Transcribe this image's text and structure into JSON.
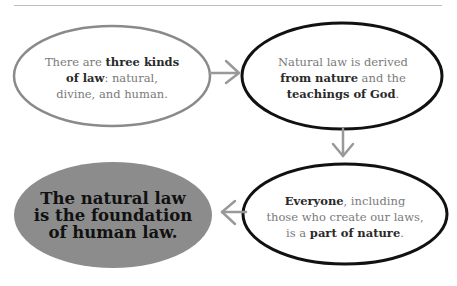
{
  "colors": {
    "outline_gray": "#8a8a8a",
    "outline_black": "#111111",
    "arrow_gray": "#999999",
    "fill_gray": "#8c8c8c",
    "text_gray": "#7a7a7a",
    "text_dark": "#2a2a2a"
  },
  "nodes": [
    {
      "id": "three-kinds",
      "parts": [
        {
          "text": "There are ",
          "bold": false
        },
        {
          "text": "three kinds of law",
          "bold": true
        },
        {
          "text": ": natural, divine, and human.",
          "bold": false
        }
      ]
    },
    {
      "id": "derived-from-nature",
      "parts": [
        {
          "text": "Natural law is derived ",
          "bold": false
        },
        {
          "text": "from nature",
          "bold": true
        },
        {
          "text": " and the ",
          "bold": false
        },
        {
          "text": "teachings of God",
          "bold": true
        },
        {
          "text": ".",
          "bold": false
        }
      ]
    },
    {
      "id": "everyone-part-of-nature",
      "parts": [
        {
          "text": "Everyone",
          "bold": true
        },
        {
          "text": ", including those who create our laws, is a ",
          "bold": false
        },
        {
          "text": "part of nature",
          "bold": true
        },
        {
          "text": ".",
          "bold": false
        }
      ]
    },
    {
      "id": "conclusion",
      "text": "The natural law is the foundation of human law."
    }
  ],
  "arrows": [
    {
      "from": "three-kinds",
      "to": "derived-from-nature",
      "direction": "right"
    },
    {
      "from": "derived-from-nature",
      "to": "everyone-part-of-nature",
      "direction": "down"
    },
    {
      "from": "everyone-part-of-nature",
      "to": "conclusion",
      "direction": "left"
    }
  ],
  "text": {
    "n1_a": "There are ",
    "n1_b": "three kinds",
    "n1_c": "of law",
    "n1_d": ": natural,",
    "n1_e": "divine, and human.",
    "n2_a": "Natural law is derived",
    "n2_b": "from nature",
    "n2_c": " and the",
    "n2_d": "teachings of God",
    "n2_e": ".",
    "n3_a": "Everyone",
    "n3_b": ", including",
    "n3_c": "those who create our laws,",
    "n3_d": "is a ",
    "n3_e": "part of nature",
    "n3_f": ".",
    "n4_a": "The natural law",
    "n4_b": "is the foundation",
    "n4_c": "of human law."
  }
}
